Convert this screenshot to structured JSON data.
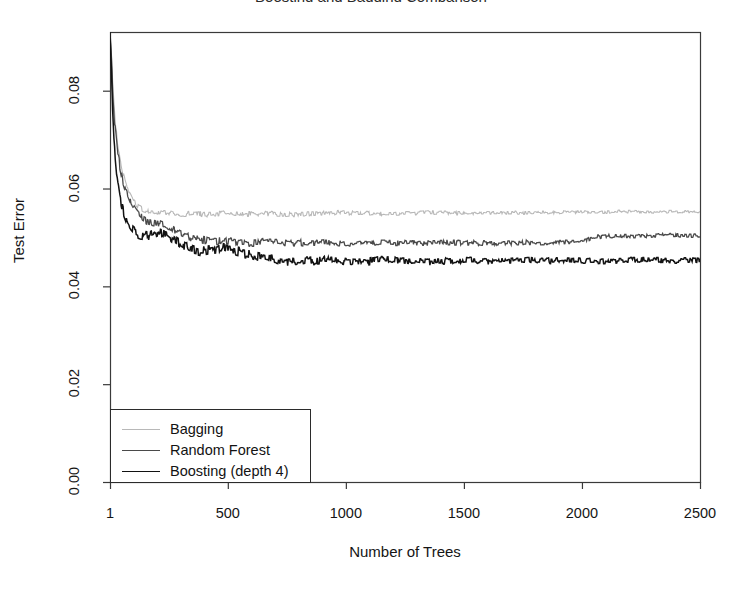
{
  "figure": {
    "width": 742,
    "height": 590,
    "background": "#ffffff",
    "title_remnant": "Boosting and Bagging Comparison"
  },
  "chart_data": {
    "type": "line",
    "title": "",
    "xlabel": "Number of Trees",
    "ylabel": "Test Error",
    "xlim": [
      1,
      2500
    ],
    "ylim": [
      0.0,
      0.092
    ],
    "grid": false,
    "legend_position": "bottom-left",
    "xticks": [
      1,
      500,
      1000,
      1500,
      2000,
      2500
    ],
    "xtick_labels": [
      "1",
      "500",
      "1000",
      "1500",
      "2000",
      "2500"
    ],
    "yticks": [
      0.0,
      0.02,
      0.04,
      0.06,
      0.08
    ],
    "ytick_labels": [
      "0.00",
      "0.02",
      "0.04",
      "0.06",
      "0.08"
    ],
    "series": [
      {
        "name": "Bagging",
        "color": "#b8b8b8",
        "width": 1.1,
        "x": [
          1,
          6,
          12,
          20,
          30,
          42,
          55,
          70,
          85,
          100,
          120,
          140,
          165,
          190,
          215,
          245,
          275,
          310,
          345,
          385,
          425,
          470,
          515,
          565,
          615,
          670,
          725,
          785,
          845,
          910,
          975,
          1045,
          1115,
          1190,
          1265,
          1345,
          1425,
          1510,
          1595,
          1685,
          1775,
          1870,
          1965,
          2065,
          2165,
          2270,
          2375,
          2485,
          2500
        ],
        "y": [
          0.092,
          0.0885,
          0.082,
          0.0755,
          0.0705,
          0.0665,
          0.0632,
          0.0606,
          0.0588,
          0.0575,
          0.0563,
          0.0556,
          0.0551,
          0.0549,
          0.0552,
          0.0551,
          0.0548,
          0.0547,
          0.0549,
          0.0548,
          0.0547,
          0.0549,
          0.0548,
          0.0547,
          0.0548,
          0.0549,
          0.0548,
          0.0547,
          0.0548,
          0.0549,
          0.0551,
          0.055,
          0.0549,
          0.0548,
          0.0549,
          0.0551,
          0.055,
          0.0549,
          0.055,
          0.0551,
          0.055,
          0.0551,
          0.0552,
          0.0551,
          0.0553,
          0.0552,
          0.0553,
          0.0552,
          0.0552
        ]
      },
      {
        "name": "Random Forest",
        "color": "#4a4a4a",
        "width": 1.3,
        "x": [
          1,
          6,
          12,
          20,
          30,
          42,
          55,
          70,
          85,
          100,
          120,
          140,
          165,
          190,
          215,
          245,
          275,
          310,
          345,
          385,
          425,
          470,
          515,
          565,
          615,
          670,
          725,
          785,
          845,
          910,
          975,
          1045,
          1115,
          1190,
          1265,
          1345,
          1425,
          1510,
          1595,
          1685,
          1775,
          1870,
          1965,
          2065,
          2165,
          2270,
          2375,
          2485,
          2500
        ],
        "y": [
          0.092,
          0.0878,
          0.0805,
          0.0738,
          0.0688,
          0.0648,
          0.0618,
          0.0594,
          0.0576,
          0.0562,
          0.0548,
          0.0539,
          0.0533,
          0.0529,
          0.0527,
          0.0521,
          0.0514,
          0.0506,
          0.0499,
          0.0496,
          0.0494,
          0.0493,
          0.0492,
          0.049,
          0.0489,
          0.0491,
          0.049,
          0.0489,
          0.049,
          0.0489,
          0.0488,
          0.0489,
          0.049,
          0.0489,
          0.0488,
          0.0489,
          0.049,
          0.0489,
          0.0488,
          0.0489,
          0.049,
          0.0489,
          0.049,
          0.0502,
          0.0504,
          0.0503,
          0.0505,
          0.0504,
          0.0504
        ]
      },
      {
        "name": "Boosting (depth 4)",
        "color": "#121212",
        "width": 1.5,
        "x": [
          1,
          6,
          12,
          20,
          30,
          42,
          55,
          70,
          85,
          100,
          120,
          140,
          165,
          190,
          215,
          245,
          275,
          310,
          345,
          385,
          425,
          470,
          515,
          565,
          615,
          670,
          725,
          785,
          845,
          910,
          975,
          1045,
          1115,
          1190,
          1265,
          1345,
          1425,
          1510,
          1595,
          1685,
          1775,
          1870,
          1965,
          2065,
          2165,
          2270,
          2375,
          2485,
          2500
        ],
        "y": [
          0.092,
          0.0862,
          0.0768,
          0.0684,
          0.0628,
          0.0586,
          0.0556,
          0.0535,
          0.0522,
          0.0514,
          0.0508,
          0.0505,
          0.0503,
          0.0508,
          0.0512,
          0.0506,
          0.0494,
          0.0483,
          0.0476,
          0.0472,
          0.0475,
          0.0479,
          0.0474,
          0.0468,
          0.0462,
          0.0457,
          0.0452,
          0.0449,
          0.0452,
          0.0456,
          0.0453,
          0.0449,
          0.0452,
          0.0455,
          0.0452,
          0.0449,
          0.0452,
          0.0454,
          0.0451,
          0.0453,
          0.0455,
          0.0452,
          0.0454,
          0.0451,
          0.0453,
          0.0455,
          0.0452,
          0.0454,
          0.0453
        ]
      }
    ],
    "legend": [
      {
        "label": "Bagging",
        "color": "#b8b8b8",
        "width": 1.1
      },
      {
        "label": "Random Forest",
        "color": "#4a4a4a",
        "width": 1.4
      },
      {
        "label": "Boosting (depth 4)",
        "color": "#121212",
        "width": 1.8
      }
    ]
  },
  "axes": {
    "frame_color": "#3a3a3a",
    "plot_left": 110,
    "plot_top": 32,
    "plot_right": 700,
    "plot_bottom": 482
  }
}
